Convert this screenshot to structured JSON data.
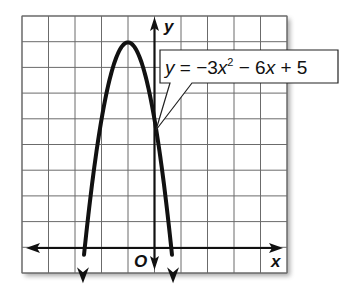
{
  "chart_data": {
    "type": "line",
    "title": "",
    "function": "y = -3x^2 - 6x + 5",
    "coefficients": {
      "a": -3,
      "b": -6,
      "c": 5
    },
    "xlabel": "x",
    "ylabel": "y",
    "origin_label": "O",
    "xlim": [
      -5.3,
      5
    ],
    "ylim": [
      -1,
      9
    ],
    "grid": true,
    "grid_step": 1,
    "vertex": [
      -1,
      8
    ],
    "y_intercept": [
      0,
      5
    ],
    "x_intercepts": [
      -2.63,
      0.63
    ],
    "series": [
      {
        "name": "y = -3x^2 - 6x + 5",
        "x": [
          -2.7,
          -2.5,
          -2,
          -1.5,
          -1,
          -0.5,
          0,
          0.5,
          0.7
        ],
        "y": [
          -0.47,
          1.25,
          5,
          7.25,
          8,
          7.25,
          5,
          1.25,
          -0.47
        ]
      }
    ],
    "annotations": [
      {
        "text": "y = −3x² − 6x + 5",
        "points_to": [
          0,
          5
        ]
      }
    ]
  },
  "labels": {
    "x_axis": "x",
    "y_axis": "y",
    "origin": "O",
    "eq_y": "y",
    "eq_eq": " = −3",
    "eq_x1": "x",
    "eq_sup": "2",
    "eq_mid": " − 6",
    "eq_x2": "x",
    "eq_end": " + 5"
  },
  "colors": {
    "ink": "#111111",
    "grid": "#6b6b6b",
    "background": "#ffffff"
  }
}
